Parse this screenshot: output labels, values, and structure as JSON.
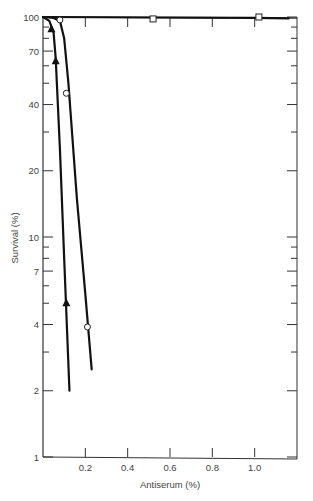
{
  "chart_data": {
    "type": "line",
    "title": "",
    "xlabel": "Antiserum (%)",
    "ylabel": "Survival (%)",
    "xlim": [
      0,
      1.2
    ],
    "ylim": [
      1,
      100
    ],
    "yscale": "log",
    "grid": false,
    "x_ticks": [
      0.2,
      0.4,
      0.6,
      0.8,
      1.0
    ],
    "x_tick_labels": [
      "0.2",
      "0.4",
      "0.6",
      "0.8",
      "1.0"
    ],
    "y_tick_labels": [
      "100",
      "70",
      "40",
      "20",
      "10",
      "7",
      "4",
      "2",
      "1"
    ],
    "y_ticks": [
      100,
      70,
      40,
      20,
      10,
      7,
      4,
      2,
      1
    ],
    "y_minor_ticks": [
      90,
      80,
      60,
      50,
      30,
      9,
      8,
      6,
      5,
      3
    ],
    "series": [
      {
        "name": "control (squares)",
        "marker": "square-open",
        "points": [
          [
            0.52,
            98
          ],
          [
            1.02,
            100
          ]
        ],
        "curve": [
          [
            0,
            100
          ],
          [
            0.5,
            99.5
          ],
          [
            1.0,
            99
          ],
          [
            1.16,
            98.5
          ]
        ]
      },
      {
        "name": "circles",
        "marker": "circle-open",
        "points": [
          [
            0.08,
            97
          ],
          [
            0.11,
            45
          ],
          [
            0.21,
            3.9
          ]
        ],
        "curve": [
          [
            0,
            100
          ],
          [
            0.05,
            99
          ],
          [
            0.08,
            96
          ],
          [
            0.1,
            80
          ],
          [
            0.12,
            50
          ],
          [
            0.16,
            15
          ],
          [
            0.2,
            5.5
          ],
          [
            0.23,
            2.5
          ]
        ]
      },
      {
        "name": "triangles",
        "marker": "triangle-filled",
        "points": [
          [
            0.04,
            88
          ],
          [
            0.06,
            63
          ],
          [
            0.11,
            5
          ]
        ],
        "curve": [
          [
            0,
            100
          ],
          [
            0.03,
            96
          ],
          [
            0.05,
            85
          ],
          [
            0.06,
            65
          ],
          [
            0.08,
            25
          ],
          [
            0.1,
            8
          ],
          [
            0.125,
            2
          ]
        ]
      }
    ]
  }
}
